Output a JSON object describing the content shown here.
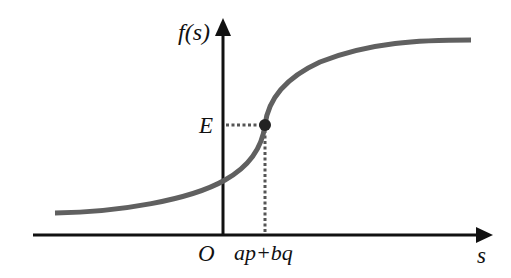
{
  "diagram": {
    "type": "function-curve",
    "y_axis_label": "f(s)",
    "x_axis_label": "s",
    "origin_label": "O",
    "point_y_label": "E",
    "point_x_label": "ap+bq",
    "colors": {
      "axis": "#111111",
      "curve": "#606060",
      "guide": "#555555",
      "point": "#222222"
    }
  }
}
